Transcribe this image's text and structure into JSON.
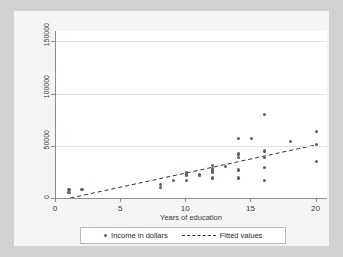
{
  "chart_data": {
    "type": "scatter",
    "title": "",
    "xlabel": "Years of education",
    "ylabel": "",
    "xlim": [
      0,
      20.8
    ],
    "ylim": [
      0,
      160000
    ],
    "xticks": [
      0,
      5,
      10,
      15,
      20
    ],
    "xtick_labels": [
      "0",
      "5",
      "10",
      "15",
      "20"
    ],
    "yticks": [
      0,
      50000,
      100000,
      150000
    ],
    "ytick_labels": [
      "0",
      "50000",
      "100000",
      "150000"
    ],
    "grid": "horizontal",
    "legend_position": "bottom-center",
    "series": [
      {
        "name": "Income in dollars",
        "marker": "circle",
        "color": "#5a5f73",
        "points": [
          [
            1,
            8000
          ],
          [
            1,
            5000
          ],
          [
            2,
            8000
          ],
          [
            8,
            13000
          ],
          [
            8,
            10000
          ],
          [
            9,
            17000
          ],
          [
            10,
            24000
          ],
          [
            10,
            22000
          ],
          [
            10,
            17000
          ],
          [
            11,
            22000
          ],
          [
            12,
            31000
          ],
          [
            12,
            28000
          ],
          [
            12,
            26000
          ],
          [
            12,
            25000
          ],
          [
            12,
            19000
          ],
          [
            13,
            30000
          ],
          [
            14,
            57000
          ],
          [
            14,
            42000
          ],
          [
            14,
            39000
          ],
          [
            14,
            27000
          ],
          [
            14,
            19000
          ],
          [
            15,
            57000
          ],
          [
            16,
            80000
          ],
          [
            16,
            45000
          ],
          [
            16,
            39000
          ],
          [
            16,
            29000
          ],
          [
            16,
            17000
          ],
          [
            18,
            54000
          ],
          [
            20,
            64000
          ],
          [
            20,
            51000
          ],
          [
            20,
            35000
          ]
        ]
      },
      {
        "name": "Fitted values",
        "type": "line",
        "style": "dashed",
        "color": "#333333",
        "endpoints": [
          [
            1.1,
            0
          ],
          [
            20,
            51000
          ]
        ]
      }
    ]
  },
  "legend": {
    "entries": [
      {
        "label": "Income in dollars",
        "marker": "dot-marker"
      },
      {
        "label": "Fitted values",
        "marker": "dashed-line-marker"
      }
    ]
  }
}
